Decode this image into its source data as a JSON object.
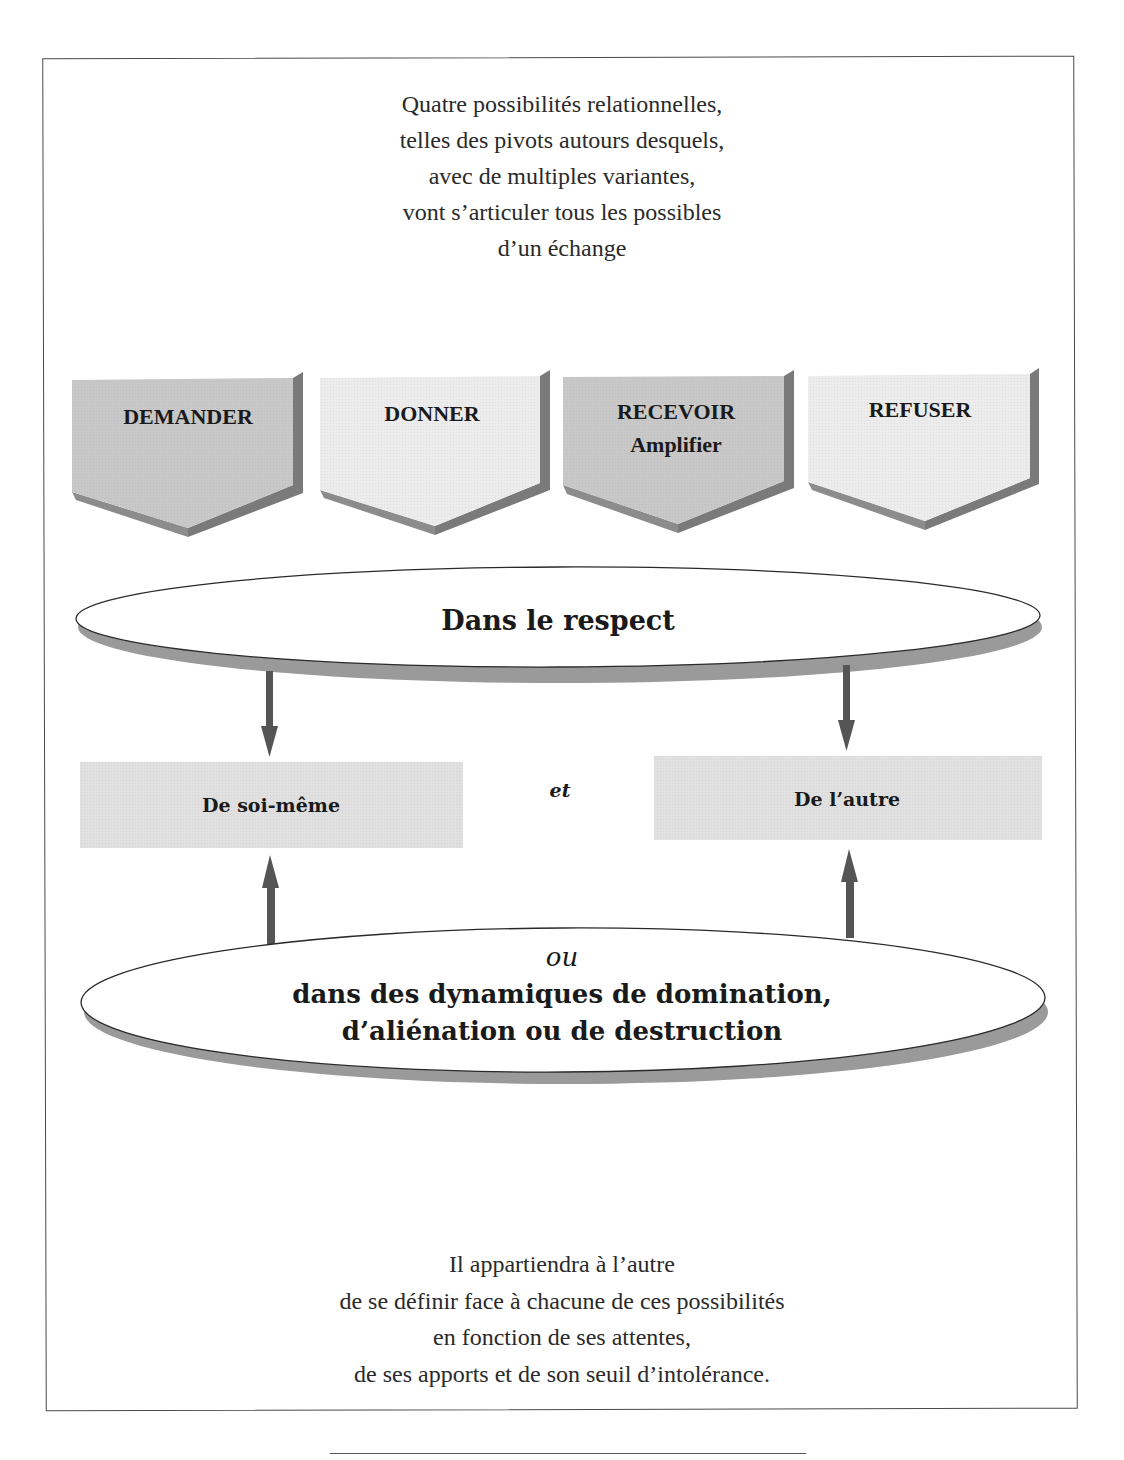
{
  "intro_text": {
    "lines": [
      "Quatre possibilités relationnelles,",
      "telles des pivots autours desquels,",
      "avec de multiples variantes,",
      "vont s’articuler tous les possibles",
      "d’un échange"
    ]
  },
  "pivots": [
    {
      "label": "DEMANDER",
      "sublabel": "",
      "fill": "#c8c8c8"
    },
    {
      "label": "DONNER",
      "sublabel": "",
      "fill": "#ececec"
    },
    {
      "label": "RECEVOIR",
      "sublabel": "Amplifier",
      "fill": "#c8c8c8"
    },
    {
      "label": "REFUSER",
      "sublabel": "",
      "fill": "#ececec"
    }
  ],
  "top_oval": {
    "label": "Dans le respect"
  },
  "boxes": {
    "left": {
      "label": "De soi-même"
    },
    "connector": "et",
    "right": {
      "label": "De l’autre"
    }
  },
  "bottom_oval": {
    "connector": "ou",
    "lines": [
      "dans des dynamiques de domination,",
      "d’aliénation ou de destruction"
    ]
  },
  "outro_text": {
    "lines": [
      "Il appartiendra à l’autre",
      "de se définir face à chacune de ces possibilités",
      "en fonction de ses attentes,",
      "de ses apports et de son seuil d’intolérance."
    ]
  },
  "colors": {
    "dark_fill": "#c8c8c8",
    "light_fill": "#ececec",
    "shadow": "#8c8c8c",
    "arrow": "#555555",
    "box_fill": "#e0e0e0",
    "border": "#4a4a4a"
  }
}
